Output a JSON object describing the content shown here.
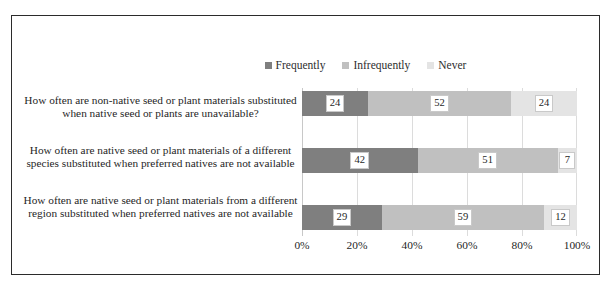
{
  "chart_data": {
    "type": "bar",
    "subtype": "100% stacked horizontal bar",
    "title": "",
    "xlabel": "",
    "ylabel": "",
    "xlim": [
      0,
      100
    ],
    "xticks": [
      "0%",
      "20%",
      "40%",
      "60%",
      "80%",
      "100%"
    ],
    "xtick_values": [
      0,
      20,
      40,
      60,
      80,
      100
    ],
    "grid": true,
    "grid_axis": "x",
    "legend_position": "top-right",
    "orientation": "horizontal",
    "categories": [
      "How often are non-native seed or plant materials substituted when native seed or plants are unavailable?",
      "How often are native seed or plant materials of a different species substituted when preferred natives are not available",
      "How often are native seed or plant materials from a different region substituted when preferred natives are not available"
    ],
    "series": [
      {
        "name": "Frequently",
        "color": "#7f7f7f",
        "values": [
          24,
          42,
          29
        ]
      },
      {
        "name": "Infrequently",
        "color": "#c0c0c0",
        "values": [
          52,
          51,
          59
        ]
      },
      {
        "name": "Never",
        "color": "#e4e4e4",
        "values": [
          24,
          7,
          12
        ]
      }
    ]
  },
  "legend": {
    "items": [
      {
        "label": "Frequently"
      },
      {
        "label": "Infrequently"
      },
      {
        "label": "Never"
      }
    ]
  },
  "axis": {
    "x_ticks": [
      "0%",
      "20%",
      "40%",
      "60%",
      "80%",
      "100%"
    ]
  },
  "categories": [
    {
      "line1": "How often are non-native seed or plant materials substituted",
      "line2": "when native seed or plants are unavailable?"
    },
    {
      "line1": "How often are native seed or plant materials of a different",
      "line2": "species substituted when preferred natives are not available"
    },
    {
      "line1": "How often are native seed or plant materials from a different",
      "line2": "region substituted when preferred natives are not available"
    }
  ],
  "bars": [
    {
      "segments": [
        {
          "value": "24",
          "series": "Frequently"
        },
        {
          "value": "52",
          "series": "Infrequently"
        },
        {
          "value": "24",
          "series": "Never"
        }
      ]
    },
    {
      "segments": [
        {
          "value": "42",
          "series": "Frequently"
        },
        {
          "value": "51",
          "series": "Infrequently"
        },
        {
          "value": "7",
          "series": "Never"
        }
      ]
    },
    {
      "segments": [
        {
          "value": "29",
          "series": "Frequently"
        },
        {
          "value": "59",
          "series": "Infrequently"
        },
        {
          "value": "12",
          "series": "Never"
        }
      ]
    }
  ]
}
